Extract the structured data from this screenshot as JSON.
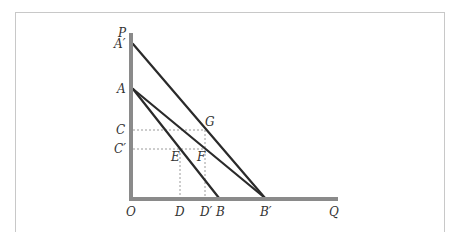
{
  "diagram": {
    "colors": {
      "axis": "#8a8a8a",
      "line": "#2a2a2a",
      "guide": "#9a9a9a",
      "label": "#333333",
      "frame": "#c8c8c8"
    },
    "axes": {
      "y_label": "P",
      "x_label": "Q",
      "origin_label": "O"
    },
    "y_labels": {
      "A_prime": "A′",
      "A": "A",
      "C": "C",
      "C_prime": "C′"
    },
    "x_labels": {
      "D": "D",
      "D_prime": "D′",
      "B": "B",
      "B_prime": "B′"
    },
    "point_labels": {
      "G": "G",
      "F": "F",
      "E": "E"
    },
    "lines": [
      {
        "name": "A-prime-B-prime",
        "from": "A′",
        "to": "B′"
      },
      {
        "name": "A-B-prime",
        "from": "A",
        "to": "B′"
      },
      {
        "name": "A-B",
        "from": "A",
        "to": "B"
      }
    ],
    "guides": [
      {
        "name": "C-G",
        "from": "C",
        "to": "G"
      },
      {
        "name": "C-prime-F",
        "from": "C′",
        "to": "F"
      },
      {
        "name": "E-D",
        "from": "E",
        "to": "D"
      },
      {
        "name": "F-D-prime",
        "from": "G",
        "to": "D′"
      }
    ]
  }
}
